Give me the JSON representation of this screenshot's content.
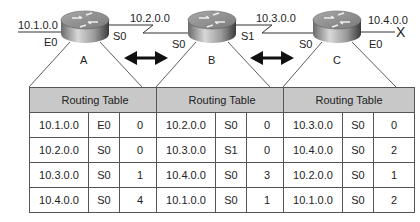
{
  "diagram": {
    "routers": [
      {
        "name": "A",
        "left_network": "10.1.0.0",
        "left_iface": "E0",
        "right_iface": "S0"
      },
      {
        "name": "B",
        "left_iface": "S0",
        "right_iface": "S1"
      },
      {
        "name": "C",
        "left_iface": "S0",
        "right_iface": "E0",
        "right_network": "10.4.0.0"
      }
    ],
    "links": [
      {
        "network": "10.2.0.0",
        "between": [
          "A",
          "B"
        ]
      },
      {
        "network": "10.3.0.0",
        "between": [
          "B",
          "C"
        ]
      }
    ],
    "failed_marker": "X",
    "exchange_arrows": [
      {
        "between": [
          "A",
          "B"
        ]
      },
      {
        "between": [
          "B",
          "C"
        ]
      }
    ]
  },
  "tables": [
    {
      "router": "A",
      "title": "Routing Table",
      "rows": [
        [
          "10.1.0.0",
          "E0",
          "0"
        ],
        [
          "10.2.0.0",
          "S0",
          "0"
        ],
        [
          "10.3.0.0",
          "S0",
          "1"
        ],
        [
          "10.4.0.0",
          "S0",
          "4"
        ]
      ]
    },
    {
      "router": "B",
      "title": "Routing Table",
      "rows": [
        [
          "10.2.0.0",
          "S0",
          "0"
        ],
        [
          "10.3.0.0",
          "S1",
          "0"
        ],
        [
          "10.4.0.0",
          "S0",
          "3"
        ],
        [
          "10.1.0.0",
          "S0",
          "1"
        ]
      ]
    },
    {
      "router": "C",
      "title": "Routing Table",
      "rows": [
        [
          "10.3.0.0",
          "S0",
          "0"
        ],
        [
          "10.4.0.0",
          "S0",
          "2"
        ],
        [
          "10.2.0.0",
          "S0",
          "1"
        ],
        [
          "10.1.0.0",
          "S0",
          "2"
        ]
      ]
    }
  ]
}
